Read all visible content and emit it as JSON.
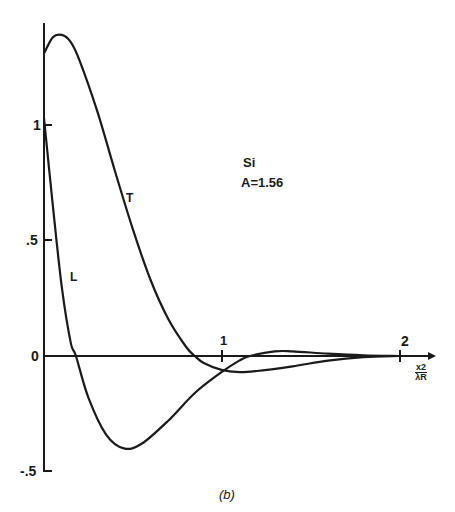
{
  "chart_data": {
    "type": "line",
    "title": "",
    "caption": "(b)",
    "annotation": [
      "Si",
      "A=1.56"
    ],
    "xlabel": "x2 / λR",
    "xlabel_numerator": "x2",
    "xlabel_denominator": "λR",
    "ylabel": "",
    "xlim": [
      0,
      2.1
    ],
    "ylim": [
      -0.5,
      1.4
    ],
    "x_ticks": [
      "1",
      "2"
    ],
    "y_ticks": [
      "1",
      ".5",
      "0",
      "-.5"
    ],
    "grid": false,
    "legend": "inline labels",
    "series": [
      {
        "name": "T",
        "x": [
          0,
          0.05,
          0.1,
          0.15,
          0.2,
          0.3,
          0.4,
          0.5,
          0.6,
          0.7,
          0.8,
          0.85,
          0.9,
          1.0,
          1.1,
          1.2,
          1.4,
          1.6,
          1.8,
          2.0
        ],
        "y": [
          1.31,
          1.38,
          1.39,
          1.36,
          1.28,
          1.06,
          0.8,
          0.55,
          0.33,
          0.16,
          0.04,
          0.0,
          -0.03,
          -0.06,
          -0.07,
          -0.065,
          -0.045,
          -0.02,
          -0.005,
          0.0
        ]
      },
      {
        "name": "L",
        "x": [
          0,
          0.05,
          0.1,
          0.15,
          0.18,
          0.25,
          0.35,
          0.45,
          0.55,
          0.7,
          0.85,
          1.0,
          1.1,
          1.16,
          1.3,
          1.4,
          1.6,
          1.8,
          2.0
        ],
        "y": [
          1.03,
          0.65,
          0.3,
          0.06,
          0.0,
          -0.18,
          -0.34,
          -0.4,
          -0.38,
          -0.28,
          -0.16,
          -0.07,
          -0.02,
          0.0,
          0.02,
          0.02,
          0.01,
          0.003,
          0.0
        ]
      }
    ]
  },
  "labels": {
    "y1": "1",
    "y05": ".5",
    "y0": "0",
    "ym05": "-.5",
    "x1": "1",
    "x2": "2",
    "curve_T": "T",
    "curve_L": "L",
    "material": "Si",
    "param": "A=1.56",
    "xnum": "x2",
    "xden": "λR",
    "caption": "(b)"
  }
}
